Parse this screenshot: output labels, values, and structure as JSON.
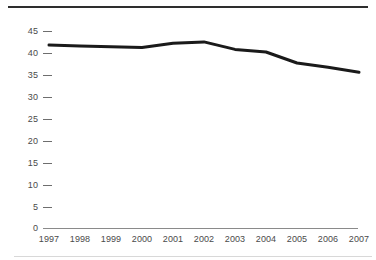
{
  "chart_data": {
    "type": "line",
    "title": "",
    "subtitle": "",
    "xlabel": "",
    "ylabel": "",
    "categories": [
      "1997",
      "1998",
      "1999",
      "2000",
      "2001",
      "2002",
      "2003",
      "2004",
      "2005",
      "2006",
      "2007"
    ],
    "x": [
      1997,
      1998,
      1999,
      2000,
      2001,
      2002,
      2003,
      2004,
      2005,
      2006,
      2007
    ],
    "values": [
      41.8,
      41.6,
      41.4,
      41.2,
      42.2,
      42.5,
      40.8,
      40.2,
      37.7,
      36.7,
      35.6
    ],
    "series": [
      {
        "name": "",
        "values": [
          41.8,
          41.6,
          41.4,
          41.2,
          42.2,
          42.5,
          40.8,
          40.2,
          37.7,
          36.7,
          35.6
        ]
      }
    ],
    "ylim": [
      0,
      45
    ],
    "xlim": [
      "1997",
      "2007"
    ],
    "ytick_labels": [
      "0",
      "5",
      "10",
      "15",
      "20",
      "25",
      "30",
      "35",
      "40",
      "45"
    ],
    "ytick_values": [
      0,
      5,
      10,
      15,
      20,
      25,
      30,
      35,
      40,
      45
    ],
    "xtick_labels": [
      "1997",
      "1998",
      "1999",
      "2000",
      "2001",
      "2002",
      "2003",
      "2004",
      "2005",
      "2006",
      "2007"
    ],
    "grid": false,
    "legend": false,
    "legend_position": "none",
    "annotations": [],
    "line_color": "#1a1a1a",
    "axis_color": "#8a8a8a",
    "tick_color": "#6e6e6e",
    "label_color": "#4a4a4a",
    "background_color": "#ffffff"
  }
}
